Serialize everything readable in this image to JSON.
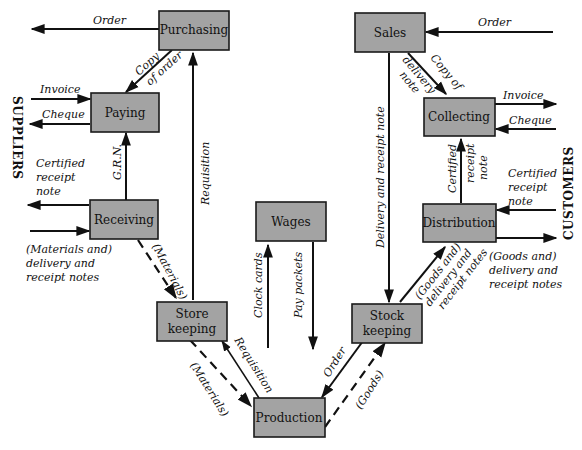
{
  "diagram": {
    "side_labels": {
      "left": "SUPPLIERS",
      "right": "CUSTOMERS"
    },
    "boxes": {
      "purchasing": "Purchasing",
      "paying": "Paying",
      "receiving": "Receiving",
      "store_keeping_1": "Store",
      "store_keeping_2": "keeping",
      "wages": "Wages",
      "production": "Production",
      "stock_keeping_1": "Stock",
      "stock_keeping_2": "keeping",
      "sales": "Sales",
      "collecting": "Collecting",
      "distribution": "Distribution"
    },
    "flows": {
      "purchasing_order": "Order",
      "copy_of_order_1": "Copy",
      "copy_of_order_2": "of order",
      "paying_invoice": "Invoice",
      "paying_cheque": "Cheque",
      "grn": "G.R.N.",
      "requisition_up": "Requisition",
      "receiving_cert_1": "Certified",
      "receiving_cert_2": "receipt",
      "receiving_cert_3": "note",
      "receiving_in_1": "(Materials and)",
      "receiving_in_2": "delivery and",
      "receiving_in_3": "receipt notes",
      "materials_to_store": "(Materials)",
      "clock_cards": "Clock cards",
      "pay_packets": "Pay packets",
      "materials_to_production": "(Materials)",
      "requisition_production": "Requisition",
      "order_production": "Order",
      "goods_production": "(Goods)",
      "sales_order": "Order",
      "copy_delivery_1": "Copy of",
      "copy_delivery_2": "delivery",
      "copy_delivery_3": "note",
      "delivery_receipt": "Delivery and receipt note",
      "collecting_invoice": "Invoice",
      "collecting_cheque": "Cheque",
      "dist_cert_1": "Certified",
      "dist_cert_2": "receipt",
      "dist_cert_3": "note",
      "cust_cert_1": "Certified",
      "cust_cert_2": "receipt",
      "cust_cert_3": "note",
      "goods_to_dist_1": "(Goods and)",
      "goods_to_dist_2": "delivery and",
      "goods_to_dist_3": "receipt notes",
      "dist_out_1": "(Goods and)",
      "dist_out_2": "delivery and",
      "dist_out_3": "receipt notes"
    }
  }
}
